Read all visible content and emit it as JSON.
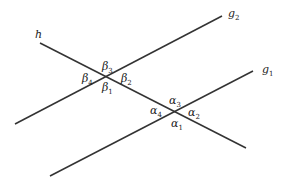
{
  "diagram": {
    "line_color": "#333333",
    "lines": [
      {
        "name": "h",
        "x1": 40,
        "y1": 43,
        "x2": 246,
        "y2": 148
      },
      {
        "name": "g2",
        "x1": 15,
        "y1": 124,
        "x2": 222,
        "y2": 16
      },
      {
        "name": "g1",
        "x1": 50,
        "y1": 176,
        "x2": 253,
        "y2": 71
      }
    ],
    "line_labels": {
      "h": {
        "base": "h",
        "sub": ""
      },
      "g2": {
        "base": "g",
        "sub": "2"
      },
      "g1": {
        "base": "g",
        "sub": "1"
      }
    },
    "intersections": {
      "beta": {
        "x": 107,
        "y": 77,
        "labels": {
          "b1": "β",
          "b1_sub": "1",
          "b2": "β",
          "b2_sub": "2",
          "b3": "β",
          "b3_sub": "3",
          "b4": "β",
          "b4_sub": "4"
        }
      },
      "alpha": {
        "x": 176,
        "y": 112,
        "labels": {
          "a1": "α",
          "a1_sub": "1",
          "a2": "α",
          "a2_sub": "2",
          "a3": "α",
          "a3_sub": "3",
          "a4": "α",
          "a4_sub": "4"
        }
      }
    }
  }
}
